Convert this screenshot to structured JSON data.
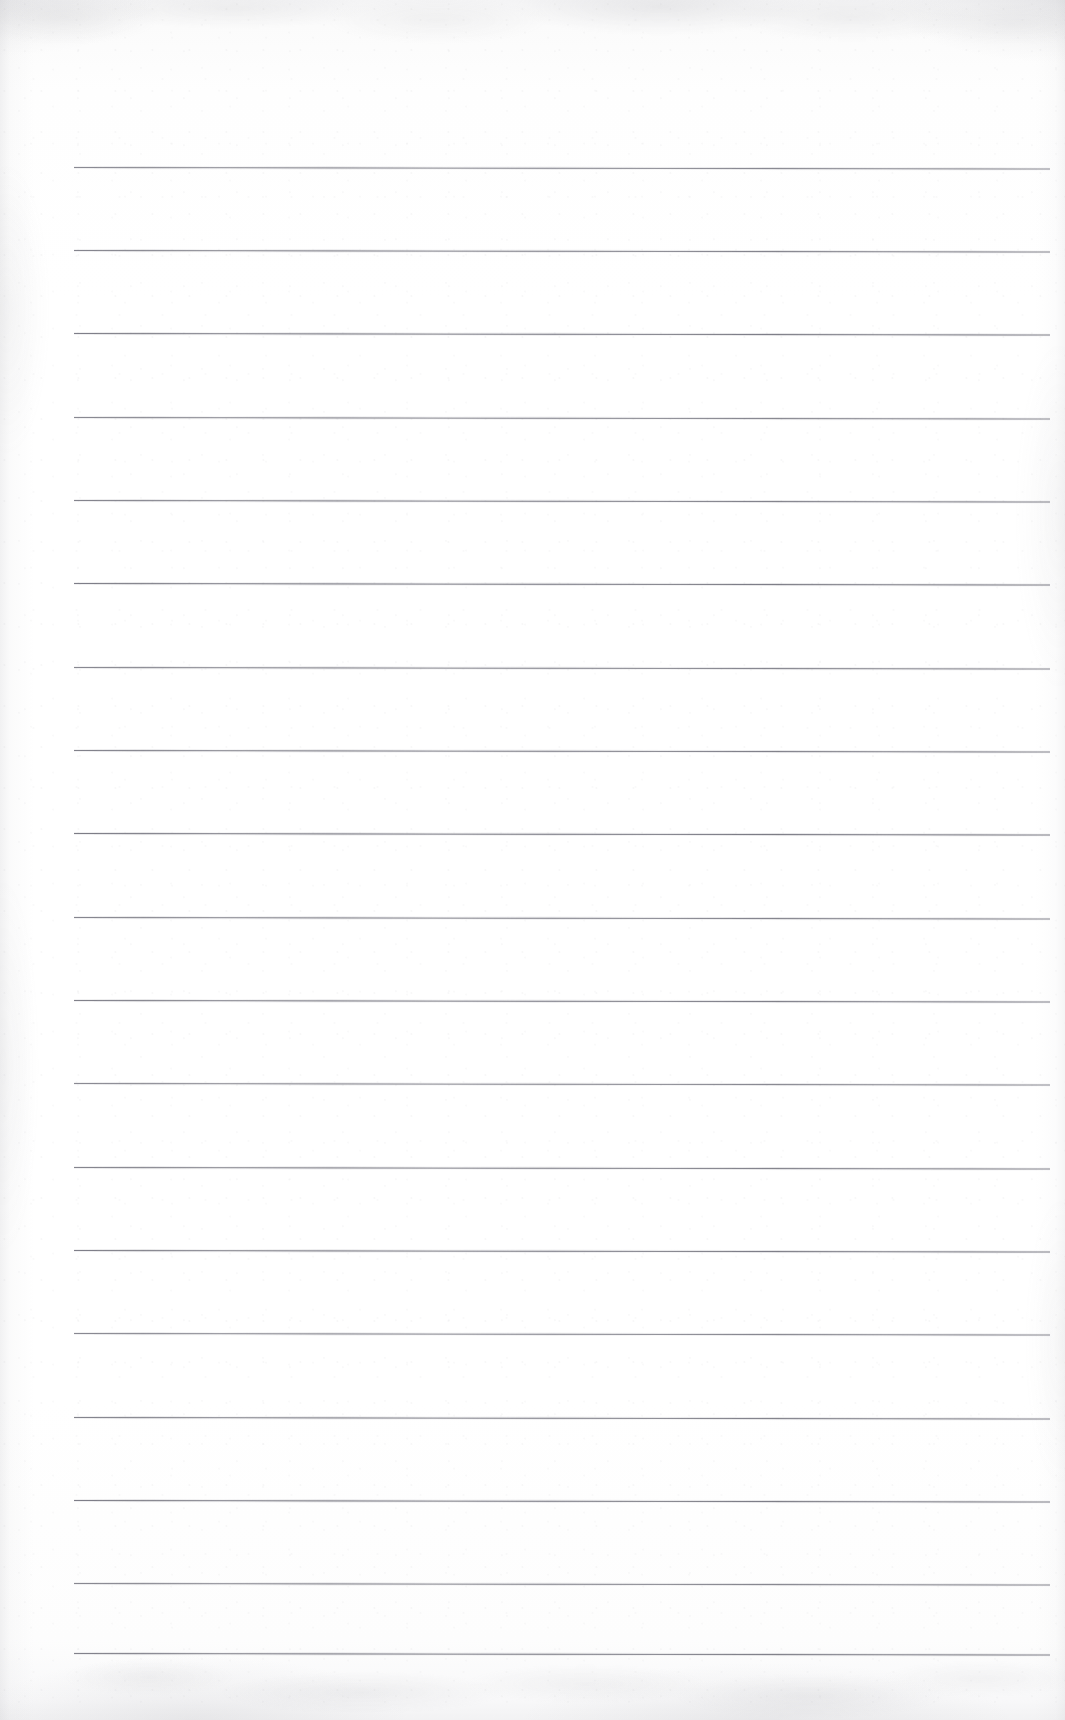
{
  "document": {
    "kind": "scanned-blank-lined-notebook-page",
    "title": "",
    "page_width": 1065,
    "page_height": 1720,
    "background_color": "#fefefe",
    "text_content": "",
    "handwriting": "",
    "printed_text": "",
    "header_text": "",
    "footer_text": "",
    "page_number": ""
  },
  "ruling": {
    "style": "horizontal ruled lines",
    "line_color": "#787882",
    "line_thickness_px": 1.4,
    "line_count": 19,
    "line_left_px": 74,
    "line_right_px": 1050,
    "line_spacing_px": 83,
    "first_line_y_px": 167,
    "last_line_y_px": 1653,
    "skew_degrees": 0.085,
    "margin_rule": "none",
    "lines_y": [
      167,
      250,
      333,
      417,
      500,
      583,
      667,
      750,
      833,
      917,
      1000,
      1083,
      1167,
      1250,
      1333,
      1417,
      1500,
      1583,
      1653
    ]
  },
  "margins": {
    "top_blank_px": 167,
    "bottom_blank_px": 67,
    "left_px": 74,
    "right_px": 15
  },
  "scan_artifacts": {
    "top_edge_shadow": true,
    "bottom_edge_mottling": true,
    "left_edge_shadow": true,
    "right_edge_shadow": true,
    "paper_grain": true,
    "noise_color": "#9696a0"
  }
}
